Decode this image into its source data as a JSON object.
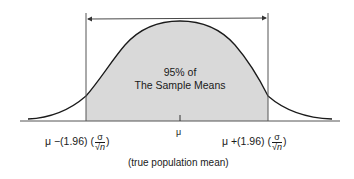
{
  "diagram": {
    "type": "normal-distribution",
    "center_text_line1": "95% of",
    "center_text_line2": "The Sample Means",
    "mu_label": "μ",
    "left_bound": {
      "prefix": "μ −(1.96) (",
      "frac_num": "σ",
      "frac_den": "√n",
      "suffix": ")"
    },
    "right_bound": {
      "prefix": "μ +(1.96) (",
      "frac_num": "σ",
      "frac_den": "√n",
      "suffix": ")"
    },
    "caption": "(true population mean)",
    "colors": {
      "fill": "#d9d9d9",
      "stroke": "#1a1a1a",
      "axis": "#555555"
    },
    "confidence_percent": 95,
    "z_value": 1.96
  }
}
